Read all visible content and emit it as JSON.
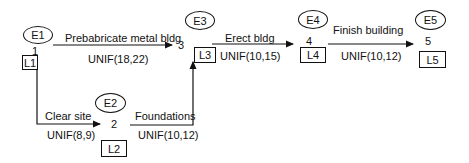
{
  "nodes": [
    {
      "id": "1",
      "event": "E1",
      "late": "L1"
    },
    {
      "id": "2",
      "event": "E2",
      "late": "L2"
    },
    {
      "id": "3",
      "event": "E3",
      "late": "L3"
    },
    {
      "id": "4",
      "event": "E4",
      "late": "L4"
    },
    {
      "id": "5",
      "event": "E5",
      "late": "L5"
    }
  ],
  "activities": [
    {
      "from": "1",
      "to": "3",
      "name": "Prebabricate metal bldg",
      "duration": "UNIF(18,22)"
    },
    {
      "from": "1",
      "to": "2",
      "name": "Clear site",
      "duration": "UNIF(8,9)"
    },
    {
      "from": "2",
      "to": "3",
      "name": "Foundations",
      "duration": "UNIF(10,12)"
    },
    {
      "from": "3",
      "to": "4",
      "name": "Erect bldg",
      "duration": "UNIF(10,15)"
    },
    {
      "from": "4",
      "to": "5",
      "name": "Finish building",
      "duration": "UNIF(10,12)"
    }
  ]
}
